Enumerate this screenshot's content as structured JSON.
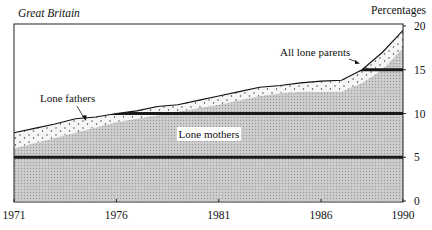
{
  "header": {
    "region_label": "Great Britain",
    "unit_label": "Percentages"
  },
  "chart_data": {
    "type": "area",
    "title": "",
    "subtitle": "Great Britain",
    "xlabel": "",
    "ylabel": "Percentages",
    "x": [
      1971,
      1972,
      1973,
      1974,
      1975,
      1976,
      1977,
      1978,
      1979,
      1980,
      1981,
      1982,
      1983,
      1984,
      1985,
      1986,
      1987,
      1988,
      1989,
      1990
    ],
    "series": [
      {
        "name": "Lone mothers",
        "values": [
          6.0,
          6.6,
          7.2,
          7.8,
          8.4,
          9.0,
          9.4,
          9.8,
          10.2,
          10.6,
          11.0,
          11.5,
          12.0,
          12.3,
          12.5,
          12.5,
          12.5,
          13.5,
          15.0,
          17.5
        ]
      },
      {
        "name": "Lone fathers",
        "values": [
          1.8,
          1.7,
          1.6,
          1.6,
          1.2,
          1.0,
          0.9,
          1.0,
          0.8,
          0.9,
          1.0,
          1.0,
          1.0,
          0.9,
          1.0,
          1.2,
          1.3,
          1.5,
          2.0,
          2.0
        ]
      },
      {
        "name": "All lone parents",
        "values": [
          7.8,
          8.3,
          8.8,
          9.4,
          9.6,
          10.0,
          10.3,
          10.8,
          11.0,
          11.5,
          12.0,
          12.5,
          13.0,
          13.2,
          13.5,
          13.7,
          13.8,
          15.0,
          17.0,
          19.5
        ]
      }
    ],
    "annotations": [
      "Lone fathers",
      "All lone parents",
      "Lone mothers"
    ],
    "x_ticks": [
      "1971",
      "1976",
      "1981",
      "1986",
      "1990"
    ],
    "y_ticks": [
      "0",
      "5",
      "10",
      "15",
      "20"
    ],
    "xlim": [
      1971,
      1990
    ],
    "ylim": [
      0,
      20
    ],
    "grid": "horizontal reference bands at 5, 10, 15",
    "legend": "none (inline labels)",
    "y_axis_position": "right"
  }
}
